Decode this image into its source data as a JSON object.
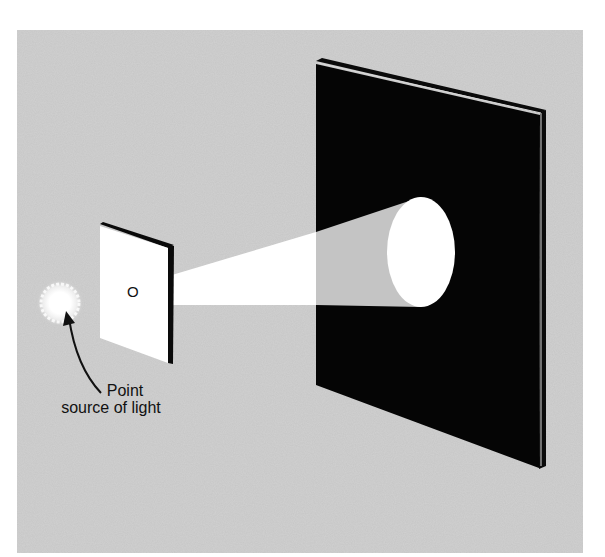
{
  "figure": {
    "background_color": "#c8c8c8",
    "screen_color": "#050505",
    "light_color": "#ffffff",
    "card_label": "O",
    "annotation": {
      "line1": "Point",
      "line2": "source of light"
    }
  }
}
